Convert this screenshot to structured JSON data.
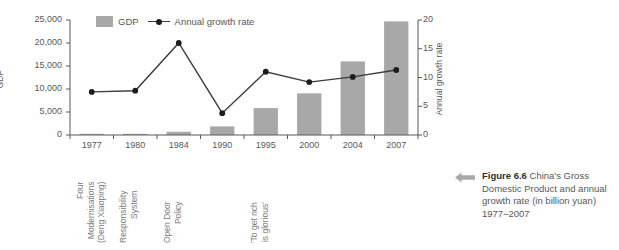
{
  "chart_data": {
    "type": "bar",
    "title": "",
    "subtitle": "",
    "categories": [
      "1977",
      "1980",
      "1984",
      "1990",
      "1995",
      "2000",
      "2004",
      "2007"
    ],
    "series": [
      {
        "name": "GDP",
        "type": "bar",
        "axis": "left",
        "unit": "billion yuan",
        "values": [
          175,
          250,
          700,
          1870,
          5850,
          9050,
          16000,
          24700
        ],
        "color": "#a8a8a8"
      },
      {
        "name": "Annual growth rate",
        "type": "line",
        "axis": "right",
        "unit": "percent",
        "values": [
          7.5,
          7.7,
          16.0,
          3.8,
          11.0,
          9.2,
          10.1,
          11.3
        ],
        "color": "#3b3b3b"
      }
    ],
    "xlabel": "",
    "ylabel": "GDP",
    "y2label": "Annual growth rate",
    "ylim": [
      0,
      25000
    ],
    "y2lim": [
      0,
      20
    ],
    "yticks": [
      "0",
      "5,000",
      "10,000",
      "15,000",
      "20,000",
      "25,000"
    ],
    "y2ticks": [
      "0",
      "5",
      "10",
      "15",
      "20"
    ],
    "grid": false,
    "legend_position": "top-left",
    "annotations": [
      {
        "category": "1977",
        "text": "Four Modernisations (Deng Xiaoping)",
        "lines": [
          "Four",
          "Modernisations",
          "(Deng Xiaoping)"
        ]
      },
      {
        "category": "1980",
        "text": "Responsibility System",
        "lines": [
          "Responsibility",
          "System"
        ]
      },
      {
        "category": "1984",
        "text": "Open Door Policy",
        "lines": [
          "Open Door",
          "Policy"
        ]
      },
      {
        "category": "1995",
        "text": "'To get rich is glorious'",
        "lines": [
          "'To get rich",
          "is glorious'"
        ]
      }
    ]
  },
  "legend": {
    "bar_label": "GDP",
    "line_label": "Annual growth rate"
  },
  "axes": {
    "left_title": "GDP",
    "right_title": "Annual growth rate"
  },
  "caption": {
    "arrow_icon": "arrow-left-icon",
    "figure_number": "Figure 6.6",
    "body": " China's Gross Domestic Product and annual growth rate (in billion yuan) 1977–2007"
  },
  "colors": {
    "bar": "#a8a8a8",
    "line": "#3b3b3b",
    "marker": "#1c1c1c",
    "axis": "#58585a",
    "text": "#58585a",
    "caption_accent": "#a8a8a8"
  }
}
